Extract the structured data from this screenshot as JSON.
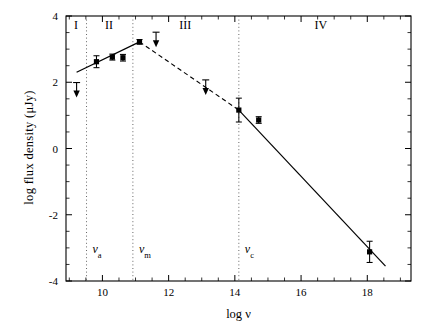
{
  "chart_data": {
    "type": "line",
    "title": "",
    "xlabel": "log ν",
    "ylabel": "log flux density (μJy)",
    "xlim": [
      8.9,
      19.32
    ],
    "ylim": [
      -4,
      4
    ],
    "grid": false,
    "legend": "none",
    "xticks": [
      10,
      12,
      14,
      16,
      18
    ],
    "xtick_labels": [
      "10",
      "12",
      "14",
      "16",
      "18"
    ],
    "xticks_minor": [
      9,
      9.5,
      10.5,
      11,
      11.5,
      12.5,
      13,
      13.5,
      14.5,
      15,
      15.5,
      16.5,
      17,
      17.5,
      18.5,
      19
    ],
    "yticks": [
      -4,
      -2,
      0,
      2,
      4
    ],
    "ytick_labels": [
      "-4",
      "-2",
      "0",
      "2",
      "4"
    ],
    "yticks_minor": [
      -3.5,
      -3,
      -2.5,
      -1.5,
      -1,
      -0.5,
      0.5,
      1,
      1.5,
      2.5,
      3,
      3.5
    ],
    "regions": [
      {
        "label": "I",
        "x_center": 9.2,
        "y": 3.62
      },
      {
        "label": "II",
        "x_center": 10.2,
        "y": 3.62
      },
      {
        "label": "III",
        "x_center": 12.5,
        "y": 3.62
      },
      {
        "label": "IV",
        "x_center": 16.6,
        "y": 3.62
      }
    ],
    "break_frequencies": [
      {
        "name": "nu_a",
        "symbol": "ν",
        "subscript": "a",
        "x": 9.52,
        "label_y": -3.15
      },
      {
        "name": "nu_m",
        "symbol": "ν",
        "subscript": "m",
        "x": 10.92,
        "label_y": -3.15
      },
      {
        "name": "nu_c",
        "symbol": "ν",
        "subscript": "c",
        "x": 14.12,
        "label_y": -3.15
      }
    ],
    "series": [
      {
        "name": "self-absorbed rise fit",
        "style": "solid",
        "points": [
          [
            9.22,
            2.3
          ],
          [
            11.12,
            3.22
          ]
        ]
      },
      {
        "name": "optically thin decline fit (nu_m to nu_c)",
        "style": "dashed",
        "points": [
          [
            11.12,
            3.22
          ],
          [
            14.12,
            1.16
          ]
        ]
      },
      {
        "name": "cooling break decline fit",
        "style": "solid",
        "points": [
          [
            14.12,
            1.16
          ],
          [
            18.55,
            -3.55
          ]
        ]
      }
    ],
    "detections": [
      {
        "x": 9.82,
        "y": 2.62,
        "yerr": 0.18
      },
      {
        "x": 10.3,
        "y": 2.76,
        "yerr": 0.09
      },
      {
        "x": 10.62,
        "y": 2.74,
        "yerr": 0.1
      },
      {
        "x": 11.12,
        "y": 3.22,
        "yerr": 0.07
      },
      {
        "x": 14.12,
        "y": 1.16,
        "yerr": 0.36
      },
      {
        "x": 14.72,
        "y": 0.86,
        "yerr": 0.1
      },
      {
        "x": 18.07,
        "y": -3.12,
        "yerr": 0.32
      }
    ],
    "upper_limits": [
      {
        "x": 9.22,
        "y": 1.78
      },
      {
        "x": 11.62,
        "y": 3.3
      },
      {
        "x": 13.12,
        "y": 1.86
      }
    ],
    "annotations": [
      "Four spectral regimes I-IV delimited by break frequencies nu_a, nu_m and nu_c",
      "Downward arrows denote upper limits",
      "Solid segments are fitted power laws; dashed segment spans nu_m to nu_c"
    ]
  },
  "axes": {
    "x_title": "log ν",
    "y_title": "log flux density (μJy)"
  }
}
